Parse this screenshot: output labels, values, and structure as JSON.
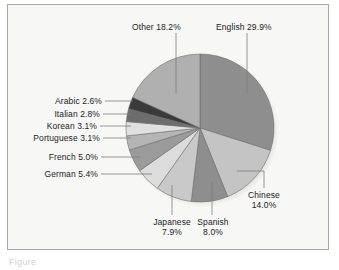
{
  "figure": {
    "caption": "Figure",
    "background_color": "#f7f7f5",
    "border_color": "#a8a8a6"
  },
  "chart_data": {
    "type": "pie",
    "title": "",
    "xlabel": "",
    "ylabel": "",
    "legend_position": "none",
    "grid": false,
    "start_angle_deg": 0,
    "direction": "clockwise",
    "units": "percent",
    "categories": [
      "English",
      "Chinese",
      "Spanish",
      "Japanese",
      "German",
      "French",
      "Portuguese",
      "Korean",
      "Italian",
      "Arabic",
      "Other"
    ],
    "values": [
      29.9,
      14.0,
      8.0,
      7.9,
      5.4,
      5.0,
      3.1,
      3.1,
      2.8,
      2.6,
      18.2
    ],
    "slices": [
      {
        "label": "English",
        "value": 29.9,
        "text": "English 29.9%",
        "color": "#8e8e8e"
      },
      {
        "label": "Chinese",
        "value": 14.0,
        "text": "Chinese",
        "text2": "14.0%",
        "color": "#c4c4c4"
      },
      {
        "label": "Spanish",
        "value": 8.0,
        "text": "Spanish",
        "text2": "8.0%",
        "color": "#8e8e8e"
      },
      {
        "label": "Japanese",
        "value": 7.9,
        "text": "Japanese",
        "text2": "7.9%",
        "color": "#c9c9c9"
      },
      {
        "label": "German",
        "value": 5.4,
        "text": "German 5.4%",
        "color": "#dcdcdc"
      },
      {
        "label": "French",
        "value": 5.0,
        "text": "French 5.0%",
        "color": "#9b9b9b"
      },
      {
        "label": "Portuguese",
        "value": 3.1,
        "text": "Portuguese 3.1%",
        "color": "#b5b5b5"
      },
      {
        "label": "Korean",
        "value": 3.1,
        "text": "Korean 3.1%",
        "color": "#e0e0e0"
      },
      {
        "label": "Italian",
        "value": 2.8,
        "text": "Italian 2.8%",
        "color": "#6d6d6d"
      },
      {
        "label": "Arabic",
        "value": 2.6,
        "text": "Arabic 2.6%",
        "color": "#3a3a3a"
      },
      {
        "label": "Other",
        "value": 18.2,
        "text": "Other 18.2%",
        "color": "#b0b0b0"
      }
    ]
  }
}
